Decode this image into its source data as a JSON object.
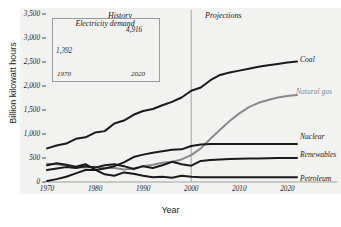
{
  "chart_data": {
    "type": "line",
    "title": "",
    "xlabel": "Year",
    "ylabel": "Billion kilowatt hours",
    "xlim": [
      1970,
      2022
    ],
    "ylim": [
      0,
      3500
    ],
    "grid": false,
    "legend_position": "right-inline-labels",
    "xticks": [
      "1970",
      "1980",
      "1990",
      "2000",
      "2010",
      "2020"
    ],
    "xtick_values": [
      1970,
      1980,
      1990,
      2000,
      2010,
      2020
    ],
    "yticks": [
      "0",
      "500",
      "1,000",
      "1,500",
      "2,000",
      "2,500",
      "3,000",
      "3,500"
    ],
    "ytick_values": [
      0,
      500,
      1000,
      1500,
      2000,
      2500,
      3000,
      3500
    ],
    "annotations": {
      "history": "History",
      "projections": "Projections",
      "divider_year": 2000
    },
    "colors": {
      "coal": "#1a1a1a",
      "natural_gas": "#8a8a8a",
      "nuclear": "#1a1a1a",
      "renewables": "#1a1a1a",
      "petroleum": "#1a1a1a",
      "divider": "#9a9a9a",
      "plot_background": "#f2f2f0",
      "axis": "#8a8a8a"
    },
    "series": [
      {
        "name": "Coal",
        "label": "Coal",
        "color": "#1a1a1a",
        "x": [
          1970,
          1972,
          1974,
          1976,
          1978,
          1980,
          1982,
          1984,
          1986,
          1988,
          1990,
          1992,
          1994,
          1996,
          1998,
          2000,
          2002,
          2004,
          2006,
          2008,
          2010,
          2012,
          2014,
          2016,
          2018,
          2020,
          2022
        ],
        "values": [
          700,
          760,
          800,
          900,
          930,
          1030,
          1060,
          1220,
          1280,
          1400,
          1480,
          1520,
          1600,
          1670,
          1760,
          1900,
          1970,
          2120,
          2230,
          2280,
          2320,
          2360,
          2400,
          2430,
          2460,
          2490,
          2510
        ]
      },
      {
        "name": "Natural gas",
        "label": "Natural gas",
        "color": "#8a8a8a",
        "x": [
          1970,
          1972,
          1974,
          1976,
          1978,
          1980,
          1982,
          1984,
          1986,
          1988,
          1990,
          1992,
          1994,
          1996,
          1998,
          2000,
          2002,
          2004,
          2006,
          2008,
          2010,
          2012,
          2014,
          2016,
          2018,
          2020,
          2022
        ],
        "values": [
          380,
          370,
          340,
          310,
          300,
          320,
          290,
          290,
          260,
          280,
          330,
          360,
          400,
          420,
          470,
          560,
          700,
          900,
          1090,
          1270,
          1430,
          1560,
          1650,
          1710,
          1760,
          1790,
          1810
        ]
      },
      {
        "name": "Nuclear",
        "label": "Nuclear",
        "color": "#1a1a1a",
        "x": [
          1970,
          1972,
          1974,
          1976,
          1978,
          1980,
          1982,
          1984,
          1986,
          1988,
          1990,
          1992,
          1994,
          1996,
          1998,
          2000,
          2002,
          2004,
          2006,
          2008,
          2010,
          2012,
          2014,
          2016,
          2018,
          2020,
          2022
        ],
        "values": [
          20,
          60,
          110,
          180,
          250,
          250,
          280,
          330,
          410,
          520,
          570,
          610,
          640,
          670,
          680,
          750,
          780,
          790,
          790,
          790,
          790,
          790,
          790,
          790,
          790,
          790,
          790
        ]
      },
      {
        "name": "Renewables",
        "label": "Renewables",
        "color": "#1a1a1a",
        "x": [
          1970,
          1972,
          1974,
          1976,
          1978,
          1980,
          1982,
          1984,
          1986,
          1988,
          1990,
          1992,
          1994,
          1996,
          1998,
          2000,
          2002,
          2004,
          2006,
          2008,
          2010,
          2012,
          2014,
          2016,
          2018,
          2020,
          2022
        ],
        "values": [
          250,
          280,
          310,
          290,
          330,
          300,
          350,
          370,
          330,
          270,
          330,
          290,
          350,
          420,
          370,
          340,
          440,
          460,
          470,
          480,
          485,
          490,
          492,
          495,
          498,
          500,
          500
        ]
      },
      {
        "name": "Petroleum",
        "label": "Petroleum",
        "color": "#1a1a1a",
        "x": [
          1970,
          1972,
          1974,
          1976,
          1978,
          1980,
          1982,
          1984,
          1986,
          1988,
          1990,
          1992,
          1994,
          1996,
          1998,
          2000,
          2002,
          2004,
          2006,
          2008,
          2010,
          2012,
          2014,
          2016,
          2018,
          2020,
          2022
        ],
        "values": [
          350,
          390,
          360,
          320,
          370,
          260,
          160,
          130,
          200,
          170,
          130,
          100,
          110,
          90,
          130,
          110,
          100,
          100,
          100,
          100,
          100,
          100,
          100,
          100,
          100,
          100,
          100
        ]
      }
    ],
    "inset": {
      "title": "Electricity demand",
      "xticks": [
        "1970",
        "2020"
      ],
      "xtick_values": [
        1970,
        2020
      ],
      "points": [
        {
          "x": 1970,
          "y": 1392,
          "label": "1,392"
        },
        {
          "x": 2020,
          "y": 4916,
          "label": "4,916"
        }
      ]
    }
  }
}
